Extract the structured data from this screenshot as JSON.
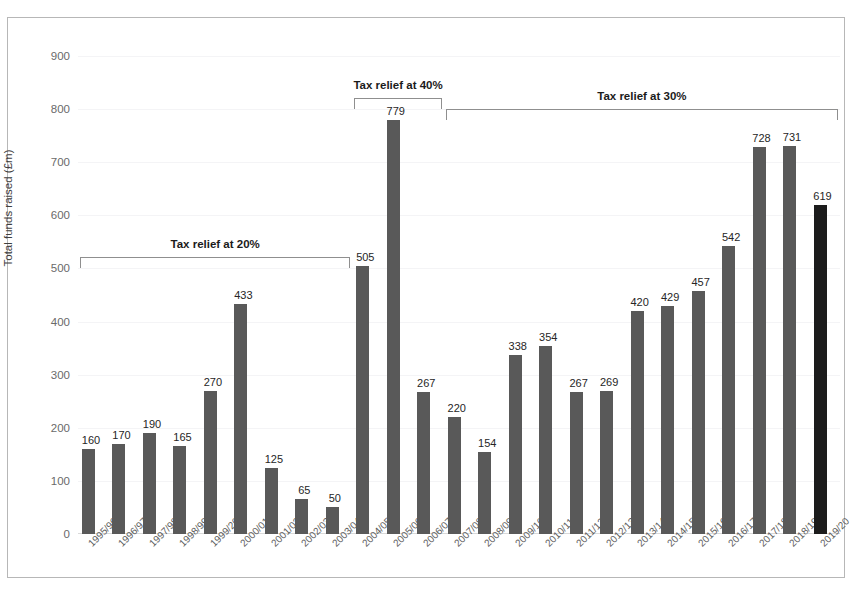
{
  "top_caption": "",
  "chart_data": {
    "type": "bar",
    "title": "",
    "xlabel": "",
    "ylabel": "Total funds raised (£m)",
    "ylim": [
      0,
      900
    ],
    "yticks": [
      0,
      100,
      200,
      300,
      400,
      500,
      600,
      700,
      800,
      900
    ],
    "grid": true,
    "legend": "none",
    "categories": [
      "1995/96",
      "1996/97",
      "1997/98",
      "1998/99",
      "1999/2000",
      "2000/01",
      "2001/02",
      "2002/03",
      "2003/04",
      "2004/05",
      "2005/06",
      "2006/07",
      "2007/08",
      "2008/09",
      "2009/10",
      "2010/11",
      "2011/12",
      "2012/13",
      "2013/14",
      "2014/15",
      "2015/16",
      "2016/17",
      "2017/18",
      "2018/19",
      "2019/20"
    ],
    "values": [
      160,
      170,
      190,
      165,
      270,
      433,
      125,
      65,
      50,
      505,
      779,
      267,
      220,
      154,
      338,
      354,
      267,
      269,
      420,
      429,
      457,
      542,
      728,
      731,
      619
    ],
    "bar_colors": {
      "default": "#595959",
      "highlight": "#1c1c1c",
      "highlight_index": 24
    },
    "annotations": [
      {
        "label": "Tax relief at 20%",
        "start_category": "1995/96",
        "end_category": "2003/04",
        "bracket_value": 500
      },
      {
        "label": "Tax relief at 40%",
        "start_category": "2004/05",
        "end_category": "2006/07",
        "bracket_value": 800
      },
      {
        "label": "Tax relief at 30%",
        "start_category": "2007/08",
        "end_category": "2019/20",
        "bracket_value": 780
      }
    ]
  }
}
